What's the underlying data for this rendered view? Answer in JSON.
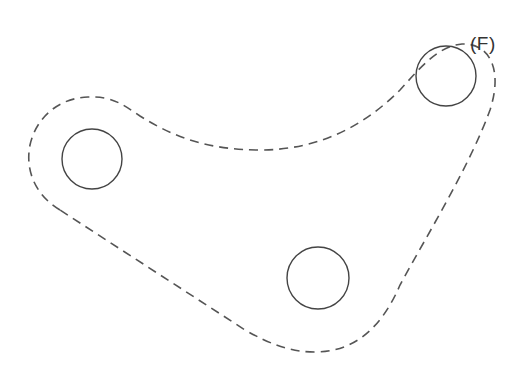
{
  "figure": {
    "label": "(F)"
  },
  "colors": {
    "outline": "#555555",
    "holes": "#444444",
    "label": "#333333",
    "background": "#ffffff"
  },
  "holes": [
    {
      "name": "left-hole",
      "cx": 92,
      "cy": 159,
      "r": 30
    },
    {
      "name": "bottom-hole",
      "cx": 318,
      "cy": 278,
      "r": 31
    },
    {
      "name": "right-hole",
      "cx": 446,
      "cy": 76,
      "r": 30
    }
  ],
  "outline": {
    "style": "dashed",
    "dash": "9 6"
  }
}
